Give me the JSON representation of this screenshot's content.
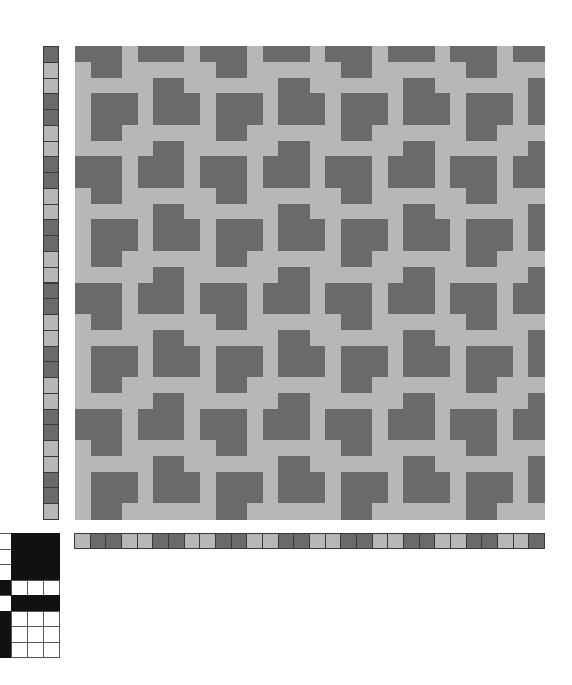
{
  "colors": {
    "dark": "#6a6a6a",
    "light": "#b7b7b7",
    "tie_black": "#111111",
    "tie_white": "#ffffff",
    "background": "#ffffff"
  },
  "drawdown": {
    "rows": 30,
    "cols": 30,
    "repeat_rows": [
      "11101110",
      "01100000",
      "00000110",
      "01110111",
      "01110111",
      "01100000",
      "00000110",
      "11101110"
    ]
  },
  "left_stripe": {
    "count": 30,
    "repeat": [
      "dark",
      "light",
      "light",
      "dark"
    ]
  },
  "bottom_stripe": {
    "count": 30,
    "repeat": [
      "light",
      "dark",
      "dark",
      "light"
    ]
  },
  "tieup": {
    "rows": [
      "0111",
      "0111",
      "0111",
      "1000",
      "0111",
      "1000",
      "1000",
      "1000"
    ]
  }
}
